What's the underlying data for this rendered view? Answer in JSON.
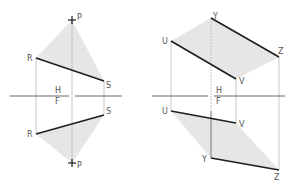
{
  "figure": {
    "left": {
      "fold_labels": {
        "top": "H",
        "bottom": "F"
      },
      "top_view": {
        "points": {
          "P": "P",
          "R": "R",
          "S": "S"
        }
      },
      "front_view": {
        "points": {
          "P": "P",
          "R": "R",
          "S": "S"
        }
      }
    },
    "right": {
      "fold_labels": {
        "top": "H",
        "bottom": "F"
      },
      "top_view": {
        "points": {
          "U": "U",
          "V": "V",
          "Y": "Y",
          "Z": "Z"
        }
      },
      "front_view": {
        "points": {
          "U": "U",
          "V": "V",
          "Y": "Y",
          "Z": "Z"
        }
      }
    },
    "colors": {
      "edge": "#1e1e1e",
      "projector": "#b8b8b8",
      "shade": "#e6e6e6",
      "label": "#555555"
    }
  }
}
